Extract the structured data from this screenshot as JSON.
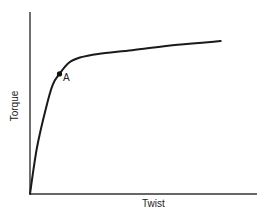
{
  "chart_data": {
    "type": "line",
    "title": "",
    "xlabel": "Twist",
    "ylabel": "Torque",
    "grid": false,
    "legend": null,
    "ticks": {
      "x": [],
      "y": []
    },
    "xlim": [
      0,
      1
    ],
    "ylim": [
      0,
      1
    ],
    "series": [
      {
        "name": "Torque-twist curve",
        "x": [
          0.0,
          0.03,
          0.07,
          0.1,
          0.13,
          0.17,
          0.22,
          0.3,
          0.45,
          0.65,
          0.84
        ],
        "y": [
          0.0,
          0.25,
          0.47,
          0.6,
          0.66,
          0.72,
          0.75,
          0.77,
          0.79,
          0.82,
          0.84
        ]
      }
    ],
    "annotations": [
      {
        "label": "A",
        "x": 0.13,
        "y": 0.66,
        "marker": "filled-circle"
      }
    ],
    "color": "#1a1a1a"
  },
  "labels": {
    "x_axis": "Twist",
    "y_axis": "Torque",
    "point_a": "A"
  }
}
